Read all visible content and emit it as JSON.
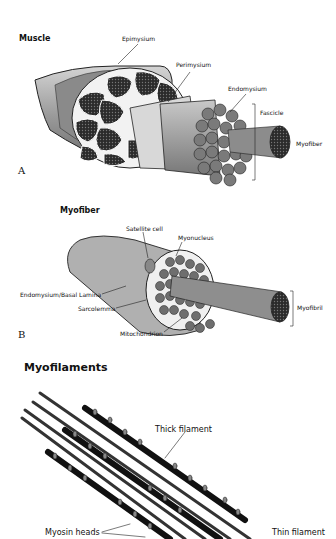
{
  "panel_a": {
    "title": "Muscle",
    "letter": "A",
    "labels": {
      "epimysium": "Epimysium",
      "perimysium": "Perimysium",
      "endomysium": "Endomysium",
      "fascicle": "Fascicle",
      "myofiber": "Myofiber"
    }
  },
  "panel_b": {
    "title": "Myofiber",
    "letter": "B",
    "labels": {
      "satellite_cell": "Satellite cell",
      "myonucleus": "Myonucleus",
      "endomysium_basal_lamina": "Endomysium/Basal Lamina",
      "sarcolemma": "Sarcolemma",
      "mitochondrion": "Mitochondrion",
      "myofibril": "Myofibril"
    }
  },
  "panel_c": {
    "title": "Myofilaments",
    "labels": {
      "thick_filament": "Thick filament",
      "myosin_heads": "Myosin heads",
      "thin_filament": "Thin filament"
    }
  }
}
